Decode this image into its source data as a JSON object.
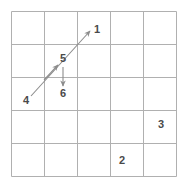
{
  "figure": {
    "kind": "grid-with-motion-arrows",
    "background_color": "#ffffff",
    "grid": {
      "rows": 5,
      "cols": 5,
      "line_color": "#b0b0b0",
      "line_width": 1,
      "x0": 11,
      "y0": 11,
      "cell_w": 33,
      "cell_h": 33
    },
    "arrow_color": "#8c8c8c",
    "label_color": "#4a4a4a",
    "arrows": [
      {
        "name": "long-diagonal-arrow",
        "x1": 31,
        "y1": 96,
        "x2": 90,
        "y2": 31,
        "direction": "up-right"
      },
      {
        "name": "mid-diagonal-arrowhead",
        "x1": 44,
        "y1": 80,
        "x2": 58,
        "y2": 65,
        "direction": "up-right"
      },
      {
        "name": "short-vertical-arrow",
        "x1": 63,
        "y1": 67,
        "x2": 63,
        "y2": 86,
        "direction": "down"
      }
    ],
    "labels": [
      {
        "name": "label-1",
        "text": "1",
        "x": 97,
        "y": 30
      },
      {
        "name": "label-5",
        "text": "5",
        "x": 63,
        "y": 59
      },
      {
        "name": "label-6",
        "text": "6",
        "x": 63,
        "y": 94
      },
      {
        "name": "label-4",
        "text": "4",
        "x": 26,
        "y": 101
      },
      {
        "name": "label-3",
        "text": "3",
        "x": 161,
        "y": 125
      },
      {
        "name": "label-2",
        "text": "2",
        "x": 122,
        "y": 161
      }
    ]
  }
}
